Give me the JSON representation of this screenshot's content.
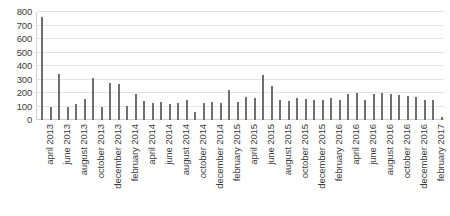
{
  "chart_data": {
    "type": "bar",
    "title": "",
    "subtitle": "",
    "xlabel": "",
    "ylabel": "",
    "ylim": [
      0,
      800
    ],
    "ytick_values": [
      0,
      100,
      200,
      300,
      400,
      500,
      600,
      700,
      800
    ],
    "ytick_labels": [
      "0",
      "100",
      "200",
      "300",
      "400",
      "500",
      "600",
      "700",
      "800"
    ],
    "grid": true,
    "legend": false,
    "legend_position": "none",
    "bar_color": "#6f6f6f",
    "grid_color": "#e4e4e4",
    "axis_color": "#cfcfcf",
    "label_interval": 2,
    "categories": [
      "april 2013",
      "may 2013",
      "june 2013",
      "july 2013",
      "august 2013",
      "september 2013",
      "october 2013",
      "november 2013",
      "december 2013",
      "january 2014",
      "february 2014",
      "march 2014",
      "april 2014",
      "may 2014",
      "june 2014",
      "july 2014",
      "august 2014",
      "september 2014",
      "october 2014",
      "november 2014",
      "december 2014",
      "january 2015",
      "february 2015",
      "march 2015",
      "april 2015",
      "may 2015",
      "june 2015",
      "july 2015",
      "august 2015",
      "september 2015",
      "october 2015",
      "november 2015",
      "december 2015",
      "january 2016",
      "february 2016",
      "march 2016",
      "april 2016",
      "may 2016",
      "june 2016",
      "july 2016",
      "august 2016",
      "september 2016",
      "october 2016",
      "november 2016",
      "december 2016",
      "january 2017",
      "february 2017",
      "march 2017"
    ],
    "tick_labels": [
      "april 2013",
      "",
      "june 2013",
      "",
      "august 2013",
      "",
      "october 2013",
      "",
      "december 2013",
      "",
      "february 2014",
      "",
      "april 2014",
      "",
      "june 2014",
      "",
      "august 2014",
      "",
      "october 2014",
      "",
      "december 2014",
      "",
      "february 2015",
      "",
      "april 2015",
      "",
      "june 2015",
      "",
      "august 2015",
      "",
      "october 2015",
      "",
      "december 2015",
      "",
      "february 2016",
      "",
      "april 2016",
      "",
      "june 2016",
      "",
      "august 2016",
      "",
      "october 2016",
      "",
      "december 2016",
      "",
      "february 2017",
      ""
    ],
    "values": [
      760,
      100,
      340,
      95,
      120,
      155,
      310,
      100,
      275,
      265,
      105,
      190,
      140,
      125,
      130,
      120,
      125,
      150,
      60,
      125,
      135,
      125,
      225,
      130,
      170,
      160,
      335,
      250,
      150,
      140,
      165,
      155,
      150,
      150,
      160,
      150,
      190,
      200,
      150,
      190,
      200,
      195,
      185,
      175,
      170,
      145,
      150,
      25
    ]
  }
}
